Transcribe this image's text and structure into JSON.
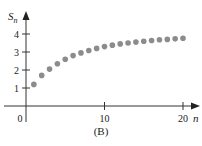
{
  "chart_data": {
    "type": "scatter",
    "title": "",
    "caption": "(B)",
    "xlabel": "n",
    "ylabel": "S_n",
    "ylabel_main": "S",
    "ylabel_sub": "n",
    "x_ticks": [
      0,
      10,
      20
    ],
    "y_ticks": [
      1,
      2,
      3,
      4
    ],
    "xlim": [
      0,
      21
    ],
    "ylim": [
      0,
      5
    ],
    "grid": false,
    "legend": null,
    "marker_color": "#8c8c8c",
    "series": [
      {
        "name": "S_n",
        "x": [
          1,
          2,
          3,
          4,
          5,
          6,
          7,
          8,
          9,
          10,
          11,
          12,
          13,
          14,
          15,
          16,
          17,
          18,
          19,
          20
        ],
        "values": [
          1.2,
          1.7,
          2.05,
          2.35,
          2.6,
          2.8,
          2.95,
          3.08,
          3.2,
          3.3,
          3.38,
          3.45,
          3.5,
          3.55,
          3.6,
          3.64,
          3.68,
          3.7,
          3.73,
          3.76
        ]
      }
    ]
  }
}
